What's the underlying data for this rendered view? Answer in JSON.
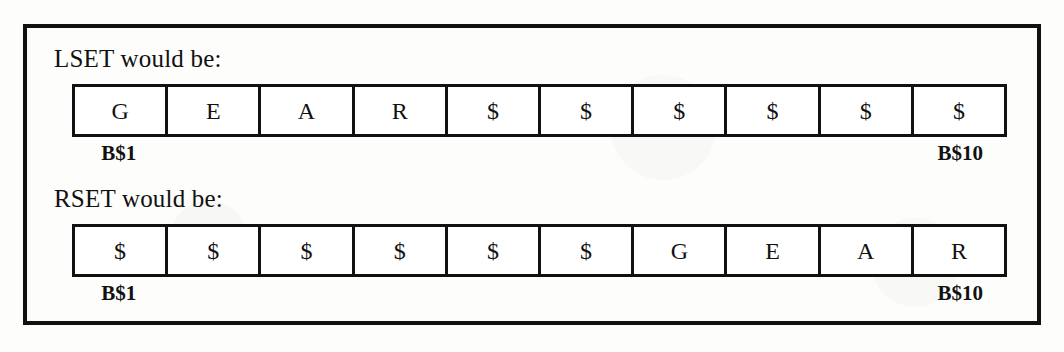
{
  "figure": {
    "fill_character": "$",
    "buffer_length": 10,
    "start_label": "B$1",
    "end_label": "B$10",
    "blocks": [
      {
        "id": "lset",
        "heading": "LSET would be:",
        "cells": [
          "G",
          "E",
          "A",
          "R",
          "$",
          "$",
          "$",
          "$",
          "$",
          "$"
        ],
        "start_label": "B$1",
        "end_label": "B$10"
      },
      {
        "id": "rset",
        "heading": "RSET would be:",
        "cells": [
          "$",
          "$",
          "$",
          "$",
          "$",
          "$",
          "G",
          "E",
          "A",
          "R"
        ],
        "start_label": "B$1",
        "end_label": "B$10"
      }
    ]
  },
  "colors": {
    "ink": "#111111",
    "paper": "#fdfdfb",
    "cell_fill": "#ffffff"
  }
}
